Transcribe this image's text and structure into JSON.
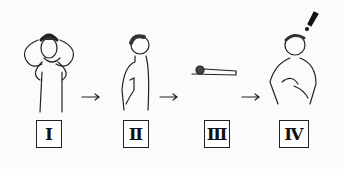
{
  "diagram": {
    "steps": [
      {
        "label": "I",
        "description": "boy with hands on head"
      },
      {
        "label": "Ⅱ",
        "description": "boy in profile touching chest"
      },
      {
        "label": "Ⅲ",
        "description": "figure lying prone"
      },
      {
        "label": "Ⅳ",
        "description": "boy with hands on chest, exclamation"
      }
    ],
    "arrows": [
      "→",
      "→",
      "→"
    ],
    "exclamation": "!"
  }
}
